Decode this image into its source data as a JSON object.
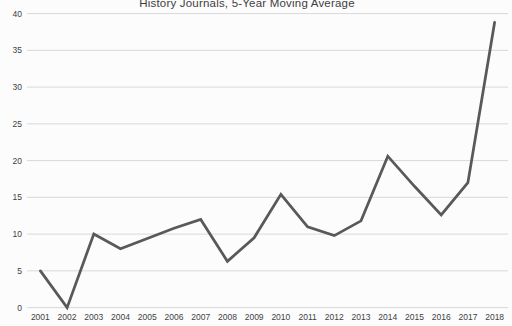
{
  "chart_data": {
    "type": "line",
    "title": "History Journals, 5-Year Moving Average",
    "categories": [
      "2001",
      "2002",
      "2003",
      "2004",
      "2005",
      "2006",
      "2007",
      "2008",
      "2009",
      "2010",
      "2011",
      "2012",
      "2013",
      "2014",
      "2015",
      "2016",
      "2017",
      "2018"
    ],
    "values": [
      5,
      0,
      10,
      8,
      9.4,
      10.8,
      12,
      6.3,
      9.5,
      15.4,
      11,
      9.8,
      11.8,
      20.6,
      16.5,
      12.6,
      17,
      38.8
    ],
    "xlabel": "",
    "ylabel": "",
    "ylim": [
      0,
      40
    ],
    "yticks": [
      0,
      5,
      10,
      15,
      20,
      25,
      30,
      35,
      40
    ],
    "grid": true,
    "legend": "none",
    "colors": {
      "line": "#595959",
      "gridline": "#d9d9d9",
      "label": "#3f3f3f",
      "title": "#404040",
      "background": "#fcfcfc"
    }
  }
}
